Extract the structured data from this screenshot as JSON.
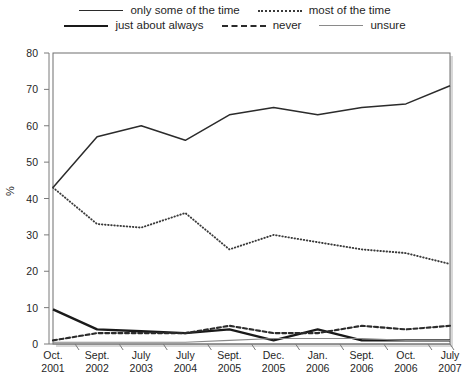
{
  "legend": {
    "rows": [
      [
        {
          "label": "only some of the time",
          "style": "solid"
        },
        {
          "label": "most of the time",
          "style": "dotted"
        }
      ],
      [
        {
          "label": "just about always",
          "style": "thick"
        },
        {
          "label": "never",
          "style": "dashed"
        },
        {
          "label": "unsure",
          "style": "thin"
        }
      ]
    ]
  },
  "axes": {
    "ylabel": "%",
    "yticks": [
      "0",
      "10",
      "20",
      "30",
      "40",
      "50",
      "60",
      "70",
      "80"
    ],
    "xticks": [
      {
        "l1": "Oct.",
        "l2": "2001"
      },
      {
        "l1": "Sept.",
        "l2": "2002"
      },
      {
        "l1": "July",
        "l2": "2003"
      },
      {
        "l1": "July",
        "l2": "2004"
      },
      {
        "l1": "Sept.",
        "l2": "2005"
      },
      {
        "l1": "Dec.",
        "l2": "2005"
      },
      {
        "l1": "Jan.",
        "l2": "2006"
      },
      {
        "l1": "Sept.",
        "l2": "2006"
      },
      {
        "l1": "Oct.",
        "l2": "2006"
      },
      {
        "l1": "July",
        "l2": "2007"
      }
    ]
  },
  "chart_data": {
    "type": "line",
    "title": "",
    "xlabel": "",
    "ylabel": "%",
    "ylim": [
      0,
      80
    ],
    "grid": false,
    "legend_position": "top",
    "categories": [
      "Oct. 2001",
      "Sept. 2002",
      "July 2003",
      "July 2004",
      "Sept. 2005",
      "Dec. 2005",
      "Jan. 2006",
      "Sept. 2006",
      "Oct. 2006",
      "July 2007"
    ],
    "series": [
      {
        "name": "only some of the time",
        "style": "solid",
        "color": "#2b2b2b",
        "values": [
          43,
          57,
          60,
          56,
          63,
          65,
          63,
          65,
          66,
          71
        ]
      },
      {
        "name": "most of the time",
        "style": "dotted",
        "color": "#3a3a3a",
        "values": [
          43,
          33,
          32,
          36,
          26,
          30,
          28,
          26,
          25,
          22
        ]
      },
      {
        "name": "just about always",
        "style": "thick",
        "color": "#1a1a1a",
        "values": [
          9.5,
          4,
          3.5,
          3,
          4,
          1,
          4,
          1,
          1,
          1
        ]
      },
      {
        "name": "never",
        "style": "dashed",
        "color": "#2b2b2b",
        "values": [
          1,
          3,
          3,
          3,
          5,
          3,
          3,
          5,
          4,
          5
        ]
      },
      {
        "name": "unsure",
        "style": "thin",
        "color": "#8a8a8a",
        "values": [
          0.5,
          0.5,
          0.5,
          0.5,
          1,
          1.5,
          1.5,
          1.5,
          1,
          1
        ]
      }
    ]
  }
}
